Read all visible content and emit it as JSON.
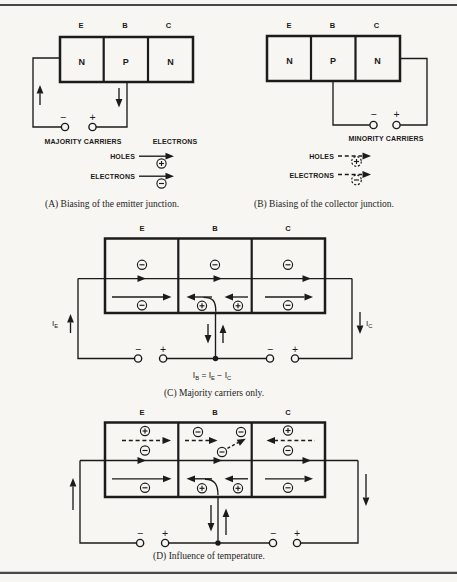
{
  "page": {
    "paper_color": "#f8f6f2",
    "ink_color": "#1b1b1b",
    "rule_color": "#474747"
  },
  "icons": {
    "electron": "circle-minus-icon",
    "hole": "circle-plus-icon",
    "terminal": "open-circle-terminal",
    "junction": "filled-dot-junction"
  },
  "panel_a": {
    "terminal_labels": [
      "E",
      "B",
      "C"
    ],
    "regions": [
      "N",
      "P",
      "N"
    ],
    "battery": {
      "minus": "−",
      "plus": "+"
    },
    "legend": {
      "left_title": "MAJORITY CARRIERS",
      "right_title": "ELECTRONS",
      "rows": [
        {
          "label": "HOLES",
          "carrier": "hole",
          "style": "solid"
        },
        {
          "label": "ELECTRONS",
          "carrier": "electron",
          "style": "solid"
        }
      ]
    },
    "caption": "(A) Biasing of the emitter junction."
  },
  "panel_b": {
    "terminal_labels": [
      "E",
      "B",
      "C"
    ],
    "regions": [
      "N",
      "P",
      "N"
    ],
    "battery": {
      "minus": "−",
      "plus": "+"
    },
    "legend": {
      "title": "MINORITY CARRIERS",
      "rows": [
        {
          "label": "HOLES",
          "carrier": "hole",
          "style": "dashed"
        },
        {
          "label": "ELECTRONS",
          "carrier": "electron",
          "style": "dashed"
        }
      ]
    },
    "caption": "(B) Biasing of the collector junction."
  },
  "panel_c": {
    "terminal_labels": [
      "E",
      "B",
      "C"
    ],
    "ie": {
      "main": "I",
      "sub": "E"
    },
    "ic": {
      "main": "I",
      "sub": "C"
    },
    "battery_left": {
      "minus": "−",
      "plus": "+"
    },
    "battery_right": {
      "minus": "−",
      "plus": "+"
    },
    "equation": {
      "p1": "I",
      "s1": "B",
      "p2": " = I",
      "s2": "E",
      "p3": " − I",
      "s3": "C"
    },
    "caption": "(C) Majority carriers only."
  },
  "panel_d": {
    "terminal_labels": [
      "E",
      "B",
      "C"
    ],
    "battery_left": {
      "minus": "−",
      "plus": "+"
    },
    "battery_right": {
      "minus": "−",
      "plus": "+"
    },
    "caption": "(D) Influence of temperature."
  }
}
